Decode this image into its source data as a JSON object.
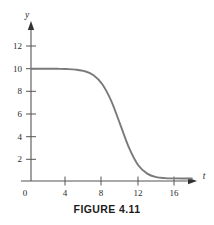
{
  "figure": {
    "caption": "FIGURE 4.11"
  },
  "chart_data": {
    "type": "line",
    "title": "FIGURE 4.11",
    "xlabel": "t",
    "ylabel": "y",
    "xlim": [
      0,
      18
    ],
    "ylim": [
      0,
      13
    ],
    "grid": false,
    "legend": null,
    "axis_color": "#555555",
    "curve_color": "#7a7a7a",
    "x_ticks": [
      {
        "value": 0,
        "label": "0"
      },
      {
        "value": 4,
        "label": "4"
      },
      {
        "value": 8,
        "label": "8"
      },
      {
        "value": 12,
        "label": "12"
      },
      {
        "value": 16,
        "label": "16"
      }
    ],
    "y_ticks": [
      {
        "value": 2,
        "label": "2"
      },
      {
        "value": 4,
        "label": "4"
      },
      {
        "value": 6,
        "label": "6"
      },
      {
        "value": 8,
        "label": "8"
      },
      {
        "value": 10,
        "label": "10"
      },
      {
        "value": 12,
        "label": "12"
      }
    ],
    "series": [
      {
        "name": "logistic-decay",
        "x": [
          0,
          1,
          2,
          3,
          4,
          5,
          6,
          7,
          8,
          9,
          10,
          11,
          12,
          13,
          14,
          15,
          16,
          17,
          18
        ],
        "y": [
          10.0,
          10.0,
          10.0,
          9.99,
          9.97,
          9.92,
          9.78,
          9.42,
          8.6,
          7.1,
          5.0,
          2.9,
          1.4,
          0.66,
          0.35,
          0.26,
          0.23,
          0.22,
          0.22
        ]
      }
    ]
  }
}
